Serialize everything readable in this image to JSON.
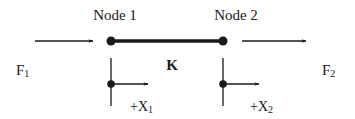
{
  "diagram": {
    "type": "spring-element",
    "nodes": [
      {
        "id": "node1",
        "label": "Node 1",
        "x": 111,
        "y": 41
      },
      {
        "id": "node2",
        "label": "Node 2",
        "x": 223,
        "y": 41
      }
    ],
    "element": {
      "label": "K",
      "from": "node1",
      "to": "node2"
    },
    "forces": [
      {
        "label_main": "F",
        "label_sub": "1",
        "at": "node1",
        "direction": "right"
      },
      {
        "label_main": "F",
        "label_sub": "2",
        "at": "node2",
        "direction": "right"
      }
    ],
    "displacements": [
      {
        "label_main": "+X",
        "label_sub": "1",
        "at": "node1",
        "direction": "right"
      },
      {
        "label_main": "+X",
        "label_sub": "2",
        "at": "node2",
        "direction": "right"
      }
    ],
    "colors": {
      "line": "#1a1a1a",
      "background": "#ffffff"
    }
  }
}
